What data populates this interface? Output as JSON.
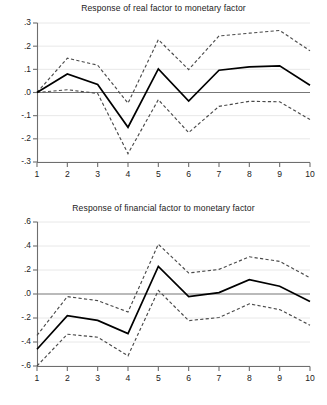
{
  "figure": {
    "background": "#ffffff",
    "solid_color": "#000000",
    "dashed_color": "#4a4a4a",
    "grid_color": "#e8e8e8",
    "axis_color": "#6e6e6e"
  },
  "panels": [
    {
      "id": "real-factor",
      "title": "Response of real factor to monetary factor"
    },
    {
      "id": "financial-factor",
      "title": "Response of financial factor to monetary factor"
    }
  ],
  "chart_data": [
    {
      "type": "line",
      "title": "Response of real factor to monetary factor",
      "xlabel": "",
      "ylabel": "",
      "x": [
        1,
        2,
        3,
        4,
        5,
        6,
        7,
        8,
        9,
        10
      ],
      "xticklabels": [
        "1",
        "2",
        "3",
        "4",
        "5",
        "6",
        "7",
        "8",
        "9",
        "10"
      ],
      "yticks": [
        -0.3,
        -0.2,
        -0.1,
        0.0,
        0.1,
        0.2,
        0.3
      ],
      "yticklabels": [
        "-.3",
        "-.2",
        "-.1",
        ".0",
        ".1",
        ".2",
        ".3"
      ],
      "ylim": [
        -0.3,
        0.3
      ],
      "xlim": [
        1,
        10
      ],
      "grid": true,
      "legend": "none",
      "zero_line": 0.0,
      "series": [
        {
          "name": "impulse response",
          "style": "solid",
          "values": [
            0.0,
            0.08,
            0.035,
            -0.15,
            0.102,
            -0.037,
            0.096,
            0.111,
            0.115,
            0.031
          ]
        },
        {
          "name": "upper confidence band",
          "style": "dashed",
          "values": [
            0.0,
            0.148,
            0.118,
            -0.046,
            0.228,
            0.099,
            0.244,
            0.256,
            0.268,
            0.18
          ]
        },
        {
          "name": "lower confidence band",
          "style": "dashed",
          "values": [
            0.0,
            0.012,
            -0.004,
            -0.264,
            -0.031,
            -0.173,
            -0.06,
            -0.038,
            -0.04,
            -0.117
          ]
        }
      ]
    },
    {
      "type": "line",
      "title": "Response of financial factor to monetary factor",
      "xlabel": "",
      "ylabel": "",
      "x": [
        1,
        2,
        3,
        4,
        5,
        6,
        7,
        8,
        9,
        10
      ],
      "xticklabels": [
        "1",
        "2",
        "3",
        "4",
        "5",
        "6",
        "7",
        "8",
        "9",
        "10"
      ],
      "yticks": [
        -0.6,
        -0.4,
        -0.2,
        0.0,
        0.2,
        0.4,
        0.6
      ],
      "yticklabels": [
        "-.6",
        "-.4",
        "-.2",
        ".0",
        ".2",
        ".4",
        ".6"
      ],
      "ylim": [
        -0.6,
        0.6
      ],
      "xlim": [
        1,
        10
      ],
      "grid": true,
      "legend": "none",
      "zero_line": 0.0,
      "series": [
        {
          "name": "impulse response",
          "style": "solid",
          "values": [
            -0.46,
            -0.18,
            -0.22,
            -0.33,
            0.23,
            -0.022,
            0.012,
            0.12,
            0.065,
            -0.062
          ]
        },
        {
          "name": "upper confidence band",
          "style": "dashed",
          "values": [
            -0.345,
            -0.022,
            -0.055,
            -0.15,
            0.415,
            0.175,
            0.205,
            0.31,
            0.272,
            0.135
          ]
        },
        {
          "name": "lower confidence band",
          "style": "dashed",
          "values": [
            -0.6,
            -0.335,
            -0.36,
            -0.515,
            0.03,
            -0.222,
            -0.196,
            -0.082,
            -0.13,
            -0.26
          ]
        }
      ]
    }
  ]
}
